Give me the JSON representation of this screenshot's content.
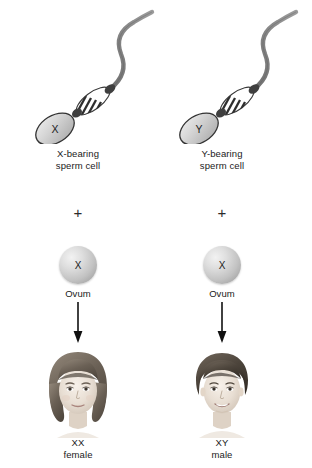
{
  "diagram": {
    "background_color": "#ffffff",
    "columns": [
      {
        "id": "x-bearing",
        "sperm": {
          "head_letter": "X",
          "label_line1": "X-bearing",
          "label_line2": "sperm cell",
          "head_color": "#d2d2d2",
          "outline_color": "#3a3a3a",
          "tail_color": "#7b7b7b"
        },
        "operator": "+",
        "ovum": {
          "letter": "X",
          "label": "Ovum",
          "color": "#c8c8c8"
        },
        "arrow": {
          "direction": "down",
          "color": "#111111"
        },
        "offspring": {
          "portrait": "girl-face",
          "genotype": "XX",
          "sex": "female",
          "hair_color": "#6d6459",
          "skin_color": "#efe6dd"
        }
      },
      {
        "id": "y-bearing",
        "sperm": {
          "head_letter": "Y",
          "label_line1": "Y-bearing",
          "label_line2": "sperm cell",
          "head_color": "#d2d2d2",
          "outline_color": "#3a3a3a",
          "tail_color": "#7b7b7b"
        },
        "operator": "+",
        "ovum": {
          "letter": "X",
          "label": "Ovum",
          "color": "#c8c8c8"
        },
        "arrow": {
          "direction": "down",
          "color": "#111111"
        },
        "offspring": {
          "portrait": "boy-face",
          "genotype": "XY",
          "sex": "male",
          "hair_color": "#4a423a",
          "skin_color": "#efe6dd"
        }
      }
    ]
  }
}
